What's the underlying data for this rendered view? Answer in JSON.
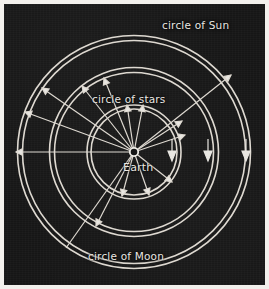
{
  "figure": {
    "background_color": "#161616",
    "border_color": "#f2f0ec",
    "line_color": "#e9e7e2"
  },
  "labels": {
    "sun": "circle of Sun",
    "stars": "circle of stars",
    "moon": "circle of Moon",
    "earth": "Earth"
  },
  "diagram": {
    "center": {
      "x": 130,
      "y": 148
    },
    "circles": [
      {
        "name": "circle of Sun",
        "radius": 114,
        "band_width": 5
      },
      {
        "name": "circle of Moon",
        "radius": 82,
        "band_width": 5
      },
      {
        "name": "circle of stars",
        "radius": 45,
        "band_width": 4
      }
    ],
    "earth_marker": {
      "radius": 4,
      "style": "open-circle"
    },
    "radial_spokes": [
      {
        "angle_deg": 180,
        "length": 118,
        "arrow": true
      },
      {
        "angle_deg": 200,
        "length": 116,
        "arrow": true
      },
      {
        "angle_deg": 215,
        "length": 112,
        "arrow": true
      },
      {
        "angle_deg": 232,
        "length": 84,
        "arrow": true
      },
      {
        "angle_deg": 248,
        "length": 80,
        "arrow": true
      },
      {
        "angle_deg": 262,
        "length": 48,
        "arrow": true
      },
      {
        "angle_deg": 272,
        "length": 48,
        "arrow": true
      },
      {
        "angle_deg": 40,
        "length": 122,
        "arrow": true
      },
      {
        "angle_deg": 30,
        "length": 62,
        "arrow": true
      },
      {
        "angle_deg": 20,
        "length": 60,
        "arrow": true
      },
      {
        "angle_deg": 118,
        "length": 84,
        "arrow": true
      },
      {
        "angle_deg": 100,
        "length": 50,
        "arrow": true
      },
      {
        "angle_deg": 80,
        "length": 50,
        "arrow": true
      },
      {
        "angle_deg": 66,
        "length": 86,
        "arrow": true
      },
      {
        "angle_deg": 125,
        "length": 118,
        "arrow": false
      }
    ],
    "motion_arrows": [
      {
        "x": 172,
        "y": 142,
        "direction": "down",
        "length": 14
      },
      {
        "x": 208,
        "y": 142,
        "direction": "down",
        "length": 14
      },
      {
        "x": 246,
        "y": 142,
        "direction": "down",
        "length": 14
      }
    ]
  }
}
